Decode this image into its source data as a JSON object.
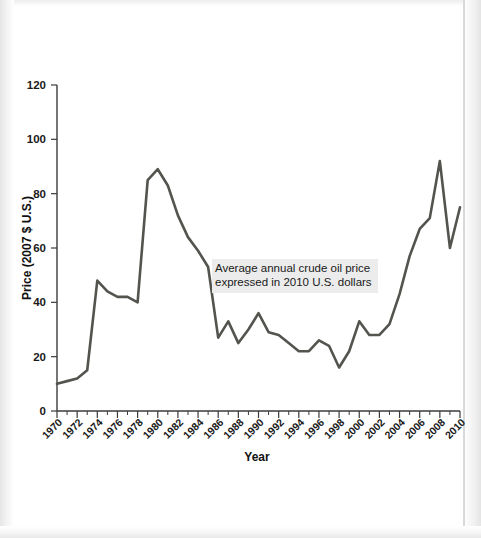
{
  "figure": {
    "background_color": "#ffffff",
    "line_color": "#54544f",
    "axis_color": "#3b3b3b",
    "annotation_bg_color": "#ececec"
  },
  "annotation": {
    "line1": "Average annual crude oil price",
    "line2": "expressed in 2010 U.S. dollars"
  },
  "chart_data": {
    "type": "line",
    "title": "",
    "xlabel": "Year",
    "ylabel": "Price (2007 $ U.S.)",
    "xlim": [
      1970,
      2010
    ],
    "ylim": [
      0,
      120
    ],
    "grid": false,
    "legend": "none",
    "ytick_labels": [
      "0",
      "20",
      "40",
      "60",
      "80",
      "100",
      "120"
    ],
    "ytick_values": [
      0,
      20,
      40,
      60,
      80,
      100,
      120
    ],
    "xtick_labels": [
      "1970",
      "1972",
      "1974",
      "1976",
      "1978",
      "1980",
      "1982",
      "1984",
      "1986",
      "1988",
      "1990",
      "1992",
      "1994",
      "1996",
      "1998",
      "2000",
      "2002",
      "2004",
      "2006",
      "2008",
      "2010"
    ],
    "xtick_values": [
      1970,
      1972,
      1974,
      1976,
      1978,
      1980,
      1982,
      1984,
      1986,
      1988,
      1990,
      1992,
      1994,
      1996,
      1998,
      2000,
      2002,
      2004,
      2006,
      2008,
      2010
    ],
    "x": [
      1970,
      1971,
      1972,
      1973,
      1974,
      1975,
      1976,
      1977,
      1978,
      1979,
      1980,
      1981,
      1982,
      1983,
      1984,
      1985,
      1986,
      1987,
      1988,
      1989,
      1990,
      1991,
      1992,
      1993,
      1994,
      1995,
      1996,
      1997,
      1998,
      1999,
      2000,
      2001,
      2002,
      2003,
      2004,
      2005,
      2006,
      2007,
      2008,
      2009,
      2010
    ],
    "values": [
      10,
      11,
      12,
      15,
      48,
      44,
      42,
      42,
      40,
      85,
      89,
      83,
      72,
      64,
      59,
      53,
      27,
      33,
      25,
      30,
      36,
      29,
      28,
      25,
      22,
      22,
      26,
      24,
      16,
      22,
      33,
      28,
      28,
      32,
      43,
      57,
      67,
      71,
      92,
      60,
      75
    ],
    "annotations": [
      {
        "text": "Average annual crude oil price expressed in 2010 U.S. dollars",
        "x": 1987,
        "y": 52
      }
    ]
  }
}
